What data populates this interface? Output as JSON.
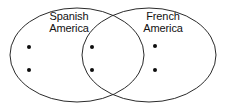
{
  "diagram": {
    "type": "venn",
    "title": "",
    "background_color": "#ffffff",
    "stroke_color": "#2b2b2b",
    "dot_color": "#0d0d0d",
    "sets": [
      {
        "id": "spanish-america",
        "label_line1": "Spanish",
        "label_line2": "America",
        "cx": 77,
        "cy": 55,
        "rx": 67,
        "ry": 47
      },
      {
        "id": "french-america",
        "label_line1": "French",
        "label_line2": "America",
        "cx": 149,
        "cy": 55,
        "rx": 67,
        "ry": 47
      }
    ],
    "regions": [
      {
        "id": "spanish-only",
        "count": 2,
        "dots": [
          {
            "x": 29,
            "y": 47
          },
          {
            "x": 29,
            "y": 70
          }
        ]
      },
      {
        "id": "intersection",
        "count": 2,
        "dots": [
          {
            "x": 92,
            "y": 47
          },
          {
            "x": 92,
            "y": 70
          }
        ]
      },
      {
        "id": "french-only",
        "count": 2,
        "dots": [
          {
            "x": 155,
            "y": 46
          },
          {
            "x": 155,
            "y": 70
          }
        ]
      }
    ],
    "dot_radius": 2
  }
}
